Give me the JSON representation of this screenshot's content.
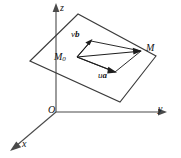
{
  "figure": {
    "background_color": "#ffffff",
    "line_color": "#3b3b3b",
    "axis_color": "#4a4a4a",
    "text_color": "#111111",
    "width": 181,
    "height": 158
  },
  "axes": {
    "z": {
      "label": "z",
      "icon": "axis-arrow-up-icon"
    },
    "y": {
      "label": "y",
      "icon": "axis-arrow-right-icon"
    },
    "x": {
      "label": "x",
      "icon": "axis-arrow-down-left-icon"
    },
    "origin": {
      "label": "O"
    }
  },
  "points": {
    "m0": {
      "label": "M",
      "subscript": "0"
    },
    "m": {
      "label": "M"
    }
  },
  "vectors": {
    "vb": {
      "scalar": "v",
      "vector": "b",
      "icon": "vector-arrow-icon"
    },
    "ua": {
      "scalar": "u",
      "vector": "a",
      "icon": "vector-arrow-icon"
    },
    "resultant": {
      "from": "M0",
      "to": "M",
      "icon": "vector-arrow-icon"
    }
  },
  "plane": {
    "name": "plane",
    "corners": [
      {
        "x": 30,
        "y": 61
      },
      {
        "x": 78,
        "y": 14
      },
      {
        "x": 156,
        "y": 56
      },
      {
        "x": 120,
        "y": 102
      }
    ]
  },
  "parallelogram": {
    "name": "vector-parallelogram",
    "corners": [
      {
        "x": 77,
        "y": 57
      },
      {
        "x": 91,
        "y": 41
      },
      {
        "x": 141,
        "y": 51
      },
      {
        "x": 115,
        "y": 72
      }
    ]
  }
}
